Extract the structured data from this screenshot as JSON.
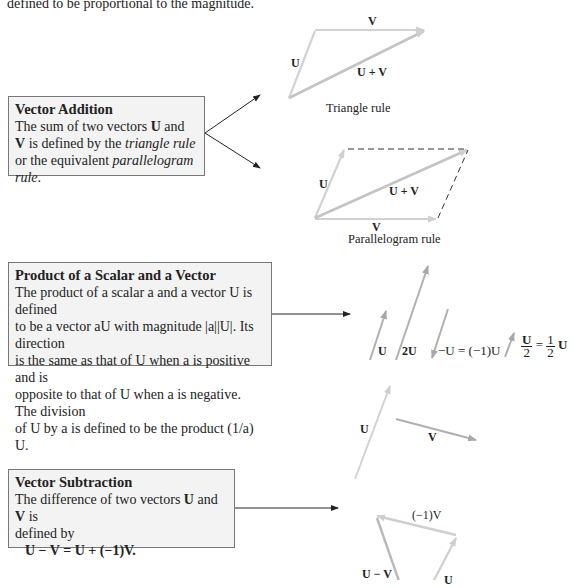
{
  "intro_text": "defined to be proportional to the magnitude.",
  "vector_addition": {
    "title": "Vector Addition",
    "body_1": "The sum of two vectors ",
    "U": "U",
    "and": " and ",
    "V": "V",
    "body_2": " is defined by the ",
    "triangle_rule": "triangle rule",
    "body_3": " or the equivalent ",
    "parallelogram_rule": "parallelogram rule",
    "period": "."
  },
  "triangle_diagram": {
    "label_U": "U",
    "label_V": "V",
    "label_sum": "U + V",
    "caption": "Triangle rule"
  },
  "parallelogram_diagram": {
    "label_U": "U",
    "label_V": "V",
    "label_sum": "U + V",
    "caption": "Parallelogram rule"
  },
  "scalar_product": {
    "title": "Product of a Scalar and a Vector",
    "line1": "The product of a scalar a and a vector U is defined",
    "line2": "to be a vector aU with magnitude |a||U|. Its direction",
    "line3": "is the same as that of U when a is positive and is",
    "line4": "opposite to that of U when a is negative. The division",
    "line5": "of U by a is defined to be the product (1/a) U."
  },
  "scalar_diagram": {
    "label_U": "U",
    "label_2U": "2U",
    "label_negU": "−U = (−1)U",
    "label_half_num": "U",
    "label_half_den": "2",
    "label_half_eq": "=",
    "label_half_frac_num": "1",
    "label_half_frac_den": "2",
    "label_half_U": "U"
  },
  "vector_subtraction": {
    "title": "Vector Subtraction",
    "body": "The difference of two vectors ",
    "U": "U",
    "and": " and ",
    "V": "V",
    "body_2": " is",
    "line2": "defined by",
    "formula": "U − V = U + (−1)V."
  },
  "subtraction_diagram": {
    "label_U": "U",
    "label_V": "V",
    "label_negV": "(−1)V",
    "label_diff": "U − V",
    "label_U_bottom": "U"
  },
  "colors": {
    "vector_light": "#cfcfcf",
    "vector_dark": "#a8a8a8",
    "box_bg": "#f3f3f3",
    "box_border": "#777777",
    "pointer_arrow": "#222222"
  }
}
